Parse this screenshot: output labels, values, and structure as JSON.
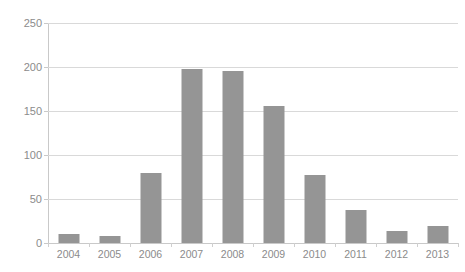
{
  "chart_data": {
    "type": "bar",
    "title": "",
    "title_note": "clipped-by-top-edge-unreadable",
    "xlabel": "",
    "ylabel": "",
    "categories": [
      "2004",
      "2005",
      "2006",
      "2007",
      "2008",
      "2009",
      "2010",
      "2011",
      "2012",
      "2013"
    ],
    "values": [
      10,
      8,
      80,
      198,
      196,
      156,
      77,
      38,
      14,
      19
    ],
    "series": [
      {
        "name": "",
        "values": [
          10,
          8,
          80,
          198,
          196,
          156,
          77,
          38,
          14,
          19
        ]
      }
    ],
    "ylim": [
      0,
      250
    ],
    "yticks": [
      0,
      50,
      100,
      150,
      200,
      250
    ],
    "ytick_labels": [
      "0",
      "50",
      "100",
      "150",
      "200",
      "250"
    ],
    "grid": true,
    "grid_axis": "y",
    "legend": false,
    "legend_position": "none",
    "bar_color": "#959595",
    "grid_color": "#d9d9d9",
    "axis_color": "#c9c9c9",
    "tick_label_color": "#8b8b8b",
    "background_color": "#ffffff"
  }
}
